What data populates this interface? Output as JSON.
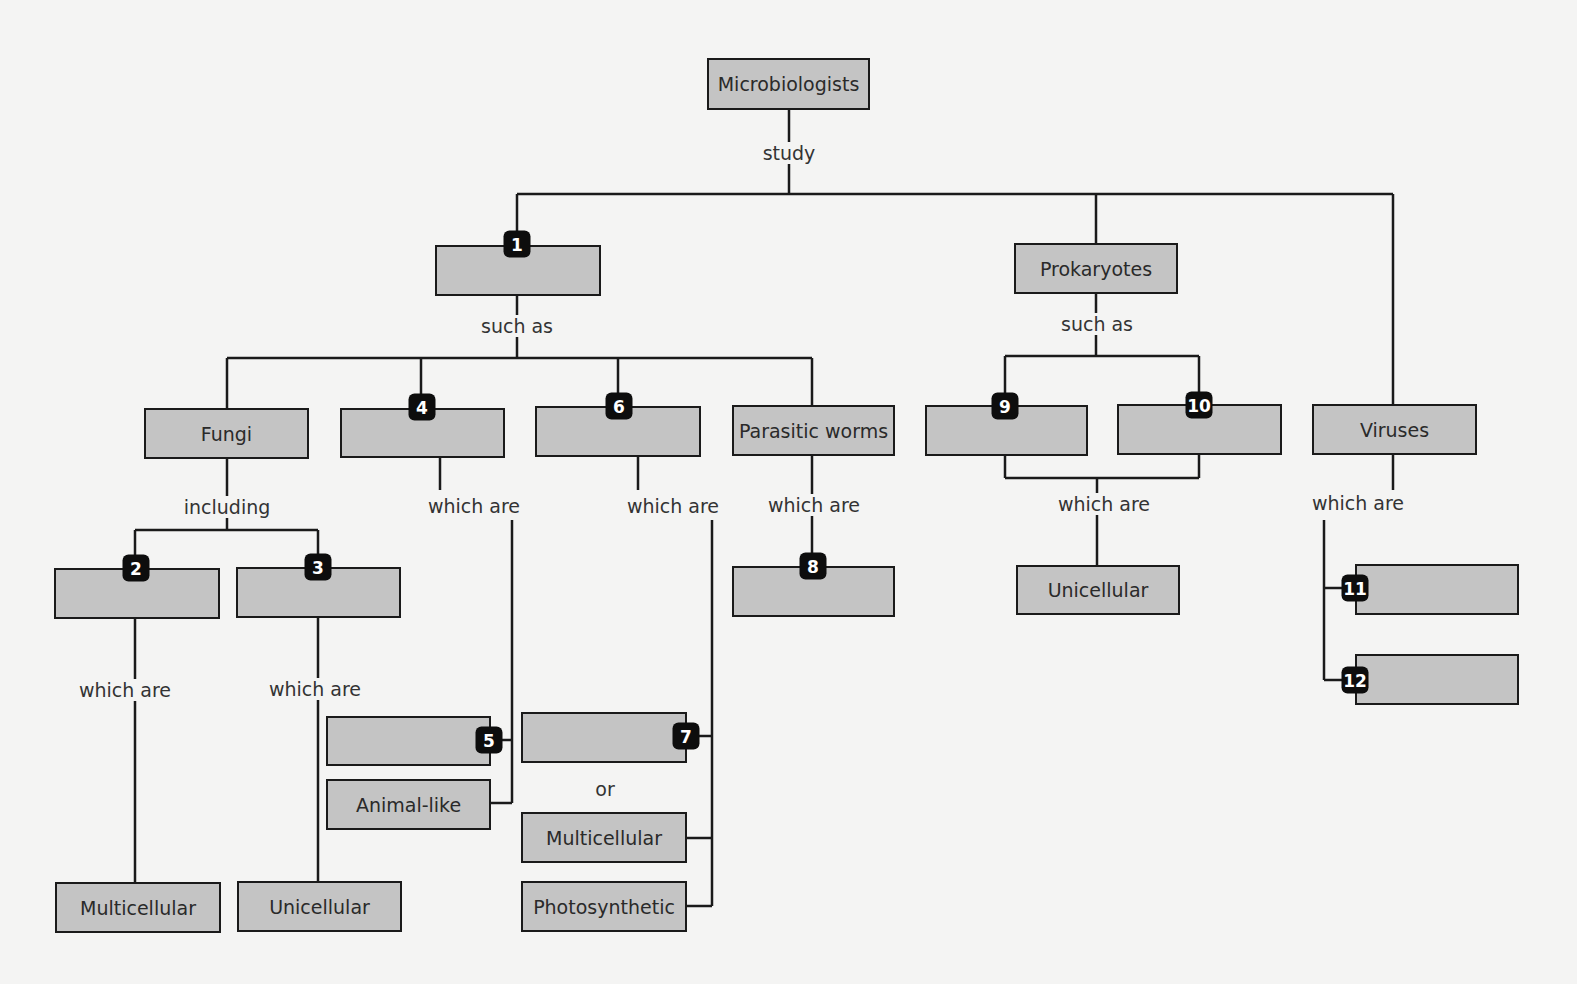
{
  "colors": {
    "box_fill": "#c4c4c4",
    "box_border": "#1a1a1a",
    "badge": "#0d0d0d",
    "background": "#f4f4f3"
  },
  "nodes": {
    "root": "Microbiologists",
    "n1": "",
    "prokaryotes": "Prokaryotes",
    "viruses": "Viruses",
    "fungi": "Fungi",
    "n4": "",
    "n6": "",
    "parasitic_worms": "Parasitic worms",
    "n9": "",
    "n10": "",
    "prok_unicellular": "Unicellular",
    "n11": "",
    "n12": "",
    "n2": "",
    "n3": "",
    "n8": "",
    "n5": "",
    "animal_like": "Animal-like",
    "n7": "",
    "multicellular_mid": "Multicellular",
    "photosynthetic": "Photosynthetic",
    "fungi_multicellular": "Multicellular",
    "fungi_unicellular": "Unicellular"
  },
  "links": {
    "study": "study",
    "such_as_1": "such as",
    "such_as_prok": "such as",
    "including": "including",
    "which_are_4": "which are",
    "which_are_6": "which are",
    "which_are_worms": "which are",
    "which_are_prok": "which are",
    "which_are_viruses": "which are",
    "which_are_2": "which are",
    "which_are_3": "which are",
    "or": "or"
  },
  "badges": {
    "b1": "1",
    "b2": "2",
    "b3": "3",
    "b4": "4",
    "b5": "5",
    "b6": "6",
    "b7": "7",
    "b8": "8",
    "b9": "9",
    "b10": "10",
    "b11": "11",
    "b12": "12"
  }
}
